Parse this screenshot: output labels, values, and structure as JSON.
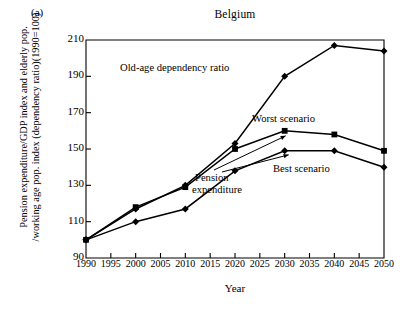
{
  "figure": {
    "panel_label": "(a)",
    "title": "Belgium",
    "xlabel": "Year",
    "ylabel_line1": "Pension expenditure/GDP index and elderly pop.",
    "ylabel_line2": "/working age pop. index (dependency ratio)(1990=100)"
  },
  "annotations": [
    {
      "name": "old-age-dependency-ratio",
      "text": "Old-age dependency ratio",
      "x": 120,
      "y": 62
    },
    {
      "name": "worst-scenario",
      "text": "Worst scenario",
      "x": 252,
      "y": 113
    },
    {
      "name": "best-scenario",
      "text": "Best scenario",
      "x": 273,
      "y": 163
    },
    {
      "name": "pension-expenditure-line1",
      "text": "Pension",
      "x": 195,
      "y": 172
    },
    {
      "name": "pension-expenditure-line2",
      "text": "expenditure",
      "x": 192,
      "y": 184
    }
  ],
  "chart_data": {
    "type": "line",
    "title": "Belgium",
    "xlabel": "Year",
    "ylabel": "Pension expenditure/GDP index and elderly pop./working age pop. index (dependency ratio)(1990=100)",
    "xlim": [
      1990,
      2050
    ],
    "ylim": [
      90,
      210
    ],
    "yticks": [
      90,
      110,
      130,
      150,
      170,
      190,
      210
    ],
    "xticks": [
      1990,
      1995,
      2000,
      2005,
      2010,
      2015,
      2020,
      2025,
      2030,
      2035,
      2040,
      2045,
      2050
    ],
    "grid": false,
    "legend_position": "inline-annotations",
    "x": [
      1990,
      2000,
      2010,
      2020,
      2030,
      2040,
      2050
    ],
    "series": [
      {
        "name": "Old-age dependency ratio",
        "marker": "diamond",
        "color": "#000000",
        "values": [
          100,
          117,
          130,
          153,
          190,
          207,
          204
        ]
      },
      {
        "name": "Worst scenario",
        "marker": "square",
        "color": "#000000",
        "values": [
          100,
          118,
          129,
          150,
          160,
          158,
          149
        ]
      },
      {
        "name": "Best scenario",
        "marker": "diamond",
        "color": "#000000",
        "values": [
          100,
          110,
          117,
          138,
          149,
          149,
          140
        ]
      }
    ]
  },
  "plot_box": {
    "left": 86,
    "right": 384,
    "top": 40,
    "bottom": 258
  }
}
